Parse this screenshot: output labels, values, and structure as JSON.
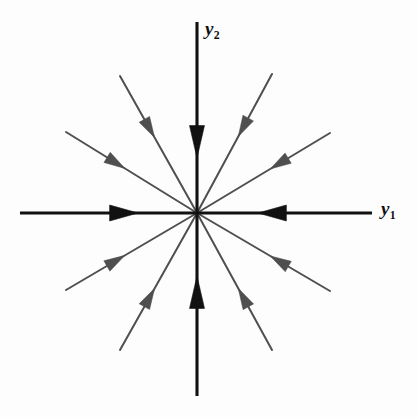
{
  "figure": {
    "kind": "phase-portrait",
    "width": 417,
    "height": 417,
    "background_color": "#fdfdfd"
  },
  "axes": {
    "horizontal": {
      "name": "y1-axis",
      "label": "y",
      "subscript": "1",
      "color": "#111111",
      "stroke_width": 3.1,
      "x_start": 20,
      "x_end": 372,
      "y": 213,
      "label_x": 381,
      "label_y": 198
    },
    "vertical": {
      "name": "y2-axis",
      "label": "y",
      "subscript": "2",
      "color": "#111111",
      "stroke_width": 3.1,
      "y_start": 22,
      "y_end": 396,
      "x": 197,
      "label_x": 205,
      "label_y": 18
    },
    "origin": {
      "x": 197,
      "y": 213
    }
  },
  "axis_arrows": [
    {
      "name": "arrow-left-axis-inward",
      "x": 117,
      "y": 213,
      "direction": "right",
      "length": 21,
      "half_width": 8.0,
      "color": "#111111"
    },
    {
      "name": "arrow-right-axis-inward",
      "x": 279,
      "y": 213,
      "direction": "left",
      "length": 21,
      "half_width": 8.0,
      "color": "#111111"
    },
    {
      "name": "arrow-top-axis-inward",
      "x": 197,
      "y": 134,
      "direction": "down",
      "length": 24,
      "half_width": 7.5,
      "color": "#111111"
    },
    {
      "name": "arrow-bottom-axis-inward",
      "x": 197,
      "y": 300,
      "direction": "up",
      "length": 24,
      "half_width": 7.5,
      "color": "#111111"
    }
  ],
  "chart_data": {
    "type": "scatter",
    "title": "",
    "xlabel": "y1",
    "ylabel": "y2",
    "system": "stable proper node (star node)",
    "flow_direction": "inward toward origin",
    "origin": {
      "x": 0,
      "y": 0
    },
    "ray_count": 12,
    "trajectories": [
      {
        "name": "ray-e",
        "angle_deg": 0,
        "arrow_inward": true,
        "color": "#111111",
        "on_axis": true
      },
      {
        "name": "ray-ene",
        "angle_deg": 30,
        "arrow_inward": true,
        "color": "#4a4a4a",
        "on_axis": false
      },
      {
        "name": "ray-nne",
        "angle_deg": 60,
        "arrow_inward": true,
        "color": "#4a4a4a",
        "on_axis": false
      },
      {
        "name": "ray-n",
        "angle_deg": 90,
        "arrow_inward": true,
        "color": "#111111",
        "on_axis": true
      },
      {
        "name": "ray-nnw",
        "angle_deg": 120,
        "arrow_inward": true,
        "color": "#4a4a4a",
        "on_axis": false
      },
      {
        "name": "ray-wnw",
        "angle_deg": 150,
        "arrow_inward": true,
        "color": "#4a4a4a",
        "on_axis": false
      },
      {
        "name": "ray-w",
        "angle_deg": 180,
        "arrow_inward": true,
        "color": "#111111",
        "on_axis": true
      },
      {
        "name": "ray-wsw",
        "angle_deg": 210,
        "arrow_inward": true,
        "color": "#4a4a4a",
        "on_axis": false
      },
      {
        "name": "ray-ssw",
        "angle_deg": 240,
        "arrow_inward": true,
        "color": "#4a4a4a",
        "on_axis": false
      },
      {
        "name": "ray-s",
        "angle_deg": 270,
        "arrow_inward": true,
        "color": "#111111",
        "on_axis": true
      },
      {
        "name": "ray-sse",
        "angle_deg": 300,
        "arrow_inward": true,
        "color": "#4a4a4a",
        "on_axis": false
      },
      {
        "name": "ray-ese",
        "angle_deg": 330,
        "arrow_inward": true,
        "color": "#4a4a4a",
        "on_axis": false
      }
    ]
  },
  "diagonal_rays": [
    {
      "name": "ray-ene",
      "x1": 197,
      "y1": 213,
      "x2": 330,
      "y2": 133,
      "arrow_t": 0.55,
      "color": "#4f4f4f",
      "stroke_width": 2.0,
      "head_len": 21,
      "head_half_width": 6.0
    },
    {
      "name": "ray-nne",
      "x1": 197,
      "y1": 213,
      "x2": 272,
      "y2": 74,
      "arrow_t": 0.55,
      "color": "#4f4f4f",
      "stroke_width": 2.0,
      "head_len": 21,
      "head_half_width": 6.0
    },
    {
      "name": "ray-nnw",
      "x1": 197,
      "y1": 213,
      "x2": 120,
      "y2": 76,
      "arrow_t": 0.55,
      "color": "#4f4f4f",
      "stroke_width": 2.0,
      "head_len": 21,
      "head_half_width": 6.0
    },
    {
      "name": "ray-wnw",
      "x1": 197,
      "y1": 213,
      "x2": 66,
      "y2": 132,
      "arrow_t": 0.55,
      "color": "#4f4f4f",
      "stroke_width": 2.0,
      "head_len": 21,
      "head_half_width": 6.0
    },
    {
      "name": "ray-wsw",
      "x1": 197,
      "y1": 213,
      "x2": 66,
      "y2": 290,
      "arrow_t": 0.55,
      "color": "#4f4f4f",
      "stroke_width": 2.0,
      "head_len": 21,
      "head_half_width": 6.0
    },
    {
      "name": "ray-ssw",
      "x1": 197,
      "y1": 213,
      "x2": 120,
      "y2": 350,
      "arrow_t": 0.55,
      "color": "#4f4f4f",
      "stroke_width": 2.0,
      "head_len": 21,
      "head_half_width": 6.0
    },
    {
      "name": "ray-sse",
      "x1": 197,
      "y1": 213,
      "x2": 272,
      "y2": 350,
      "arrow_t": 0.55,
      "color": "#4f4f4f",
      "stroke_width": 2.0,
      "head_len": 21,
      "head_half_width": 6.0
    },
    {
      "name": "ray-ese",
      "x1": 197,
      "y1": 213,
      "x2": 330,
      "y2": 291,
      "arrow_t": 0.55,
      "color": "#4f4f4f",
      "stroke_width": 2.0,
      "head_len": 21,
      "head_half_width": 6.0
    }
  ]
}
